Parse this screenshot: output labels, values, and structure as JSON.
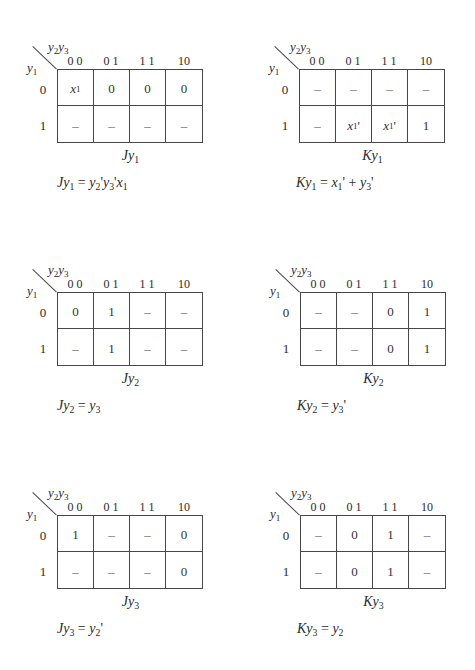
{
  "kmaps": [
    {
      "col_var": "y₂y₃",
      "row_var": "y₁",
      "col_headers": [
        "0 0",
        "0 1",
        "1 1",
        "10"
      ],
      "row_headers": [
        "0",
        "1"
      ],
      "cells": [
        [
          "x₁",
          "0",
          "0",
          "0"
        ],
        [
          "–",
          "–",
          "–",
          "–"
        ]
      ],
      "caption": "Jy₁",
      "equation": "Jy₁ = y₂'y₃'x₁"
    },
    {
      "col_var": "y₂y₃",
      "row_var": "y₁",
      "col_headers": [
        "0 0",
        "0 1",
        "1 1",
        "10"
      ],
      "row_headers": [
        "0",
        "1"
      ],
      "cells": [
        [
          "–",
          "–",
          "–",
          "–"
        ],
        [
          "–",
          "x₁'",
          "x₁'",
          "1"
        ]
      ],
      "caption": "Ky₁",
      "equation": "Ky₁ = x₁' + y₃'"
    },
    {
      "col_var": "y₂y₃",
      "row_var": "y₁",
      "col_headers": [
        "0 0",
        "0 1",
        "1 1",
        "10"
      ],
      "row_headers": [
        "0",
        "1"
      ],
      "cells": [
        [
          "0",
          "1",
          "–",
          "–"
        ],
        [
          "–",
          "1",
          "–",
          "–"
        ]
      ],
      "caption": "Jy₂",
      "equation": "Jy₂ = y₃"
    },
    {
      "col_var": "y₂y₃",
      "row_var": "y₁",
      "col_headers": [
        "0 0",
        "0 1",
        "1 1",
        "10"
      ],
      "row_headers": [
        "0",
        "1"
      ],
      "cells": [
        [
          "–",
          "–",
          "0",
          "1"
        ],
        [
          "–",
          "–",
          "0",
          "1"
        ]
      ],
      "caption": "Ky₂",
      "equation": "Ky₂ = y₃'"
    },
    {
      "col_var": "y₂y₃",
      "row_var": "y₁",
      "col_headers": [
        "0 0",
        "0 1",
        "1 1",
        "10"
      ],
      "row_headers": [
        "0",
        "1"
      ],
      "cells": [
        [
          "1",
          "–",
          "–",
          "0"
        ],
        [
          "–",
          "–",
          "–",
          "0"
        ]
      ],
      "caption": "Jy₃",
      "equation": "Jy₃ = y₂'"
    },
    {
      "col_var": "y₂y₃",
      "row_var": "y₁",
      "col_headers": [
        "0 0",
        "0 1",
        "1 1",
        "10"
      ],
      "row_headers": [
        "0",
        "1"
      ],
      "cells": [
        [
          "–",
          "0",
          "1",
          "–"
        ],
        [
          "–",
          "0",
          "1",
          "–"
        ]
      ],
      "caption": "Ky₃",
      "equation": "Ky₃ = y₂"
    }
  ]
}
